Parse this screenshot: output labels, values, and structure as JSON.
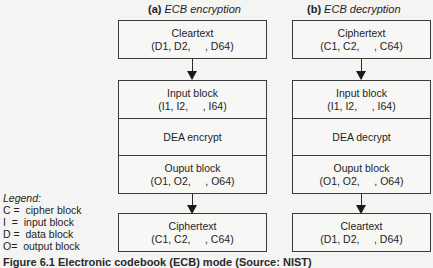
{
  "diagram": {
    "left": {
      "label_letter": "(a)",
      "label_text": "ECB encryption",
      "top_box": {
        "title": "Cleartext",
        "values": "(D1, D2,     , D64)"
      },
      "middle_box": {
        "input": {
          "title": "Input block",
          "values": "(I1, I2,     , I64)"
        },
        "operation": "DEA encrypt",
        "output": {
          "title": "Ouput block",
          "values": "(O1, O2,     , O64)"
        }
      },
      "bottom_box": {
        "title": "Ciphertext",
        "values": "(C1, C2,     , C64)"
      }
    },
    "right": {
      "label_letter": "(b)",
      "label_text": "ECB decryption",
      "top_box": {
        "title": "Ciphertext",
        "values": "(C1, C2,     , C64)"
      },
      "middle_box": {
        "input": {
          "title": "Input block",
          "values": "(I1, I2,     , I64)"
        },
        "operation": "DEA decrypt",
        "output": {
          "title": "Ouput block",
          "values": "(O1, O2,     , O64)"
        }
      },
      "bottom_box": {
        "title": "Cleartext",
        "values": "(D1, D2,     , D64)"
      }
    }
  },
  "legend": {
    "title": "Legend:",
    "items": [
      "C =  cipher block",
      "I  =  input block",
      "D =  data block",
      "O=  output block"
    ]
  },
  "caption": "Figure 6.1  Electronic codebook (ECB) mode (Source: NIST)"
}
